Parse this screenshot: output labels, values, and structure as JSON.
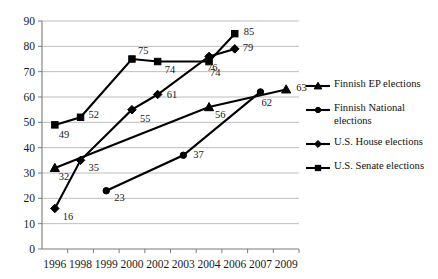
{
  "chart_data": {
    "type": "line",
    "title": "",
    "xlabel": "",
    "ylabel": "",
    "x": [
      "1996",
      "1998",
      "1999",
      "2000",
      "2002",
      "2003",
      "2004",
      "2006",
      "2007",
      "2009"
    ],
    "ylim": [
      0,
      90
    ],
    "ytick_step": 10,
    "yticks": [
      "0",
      "10",
      "20",
      "30",
      "40",
      "50",
      "60",
      "70",
      "80",
      "90"
    ],
    "grid": "horizontal",
    "legend_position": "right",
    "marker_color": "#000000",
    "line_color": "#000000",
    "gridline_color": "#b6b6b6",
    "series": [
      {
        "name": "Finnish EP elections",
        "marker": "triangle",
        "points": [
          {
            "x": "1996",
            "y": 32,
            "label": "32"
          },
          {
            "x": "2004",
            "y": 56,
            "label": "56"
          },
          {
            "x": "2009",
            "y": 63,
            "label": "63"
          }
        ]
      },
      {
        "name": "Finnish National elections",
        "marker": "circle",
        "points": [
          {
            "x": "1999",
            "y": 23,
            "label": "23"
          },
          {
            "x": "2003",
            "y": 37,
            "label": "37"
          },
          {
            "x": "2007",
            "y": 62,
            "label": "62"
          }
        ]
      },
      {
        "name": "U.S. House elections",
        "marker": "diamond",
        "points": [
          {
            "x": "1996",
            "y": 16,
            "label": "16"
          },
          {
            "x": "1998",
            "y": 35,
            "label": "35"
          },
          {
            "x": "2000",
            "y": 55,
            "label": "55"
          },
          {
            "x": "2002",
            "y": 61,
            "label": "61"
          },
          {
            "x": "2004",
            "y": 76,
            "label": "76"
          },
          {
            "x": "2006",
            "y": 79,
            "label": "79"
          }
        ]
      },
      {
        "name": "U.S. Senate elections",
        "marker": "square",
        "points": [
          {
            "x": "1996",
            "y": 49,
            "label": "49"
          },
          {
            "x": "1998",
            "y": 52,
            "label": "52"
          },
          {
            "x": "2000",
            "y": 75,
            "label": "75"
          },
          {
            "x": "2002",
            "y": 74,
            "label": "74"
          },
          {
            "x": "2004",
            "y": 74,
            "label": "74"
          },
          {
            "x": "2006",
            "y": 85,
            "label": "85"
          }
        ]
      }
    ]
  },
  "legend": {
    "items": [
      {
        "label": "Finnish EP elections",
        "marker": "triangle"
      },
      {
        "label": "Finnish National\nelections",
        "marker": "circle"
      },
      {
        "label": "U.S. House elections",
        "marker": "diamond"
      },
      {
        "label": "U.S. Senate elections",
        "marker": "square"
      }
    ]
  }
}
